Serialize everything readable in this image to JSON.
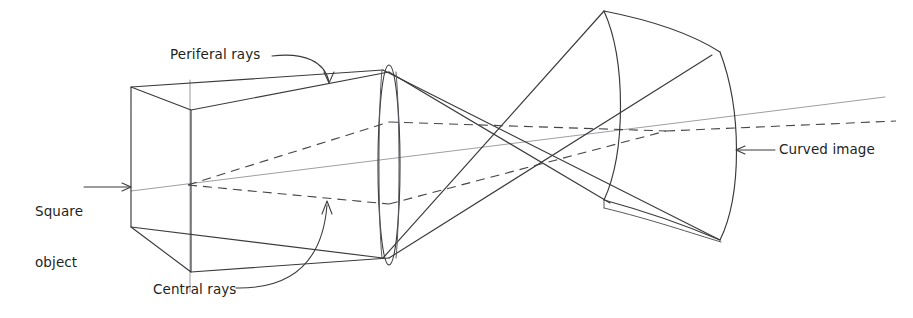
{
  "diagram": {
    "type": "optical-ray-diagram",
    "background_color": "#ffffff",
    "ink_color": "#3a3a3c",
    "axis_color": "#9a9a9e"
  },
  "labels": {
    "square_object": "Square\nobject",
    "square_object_line1": "Square",
    "square_object_line2": "object",
    "periferal_rays": "Periferal rays",
    "central_rays": "Central rays",
    "curved_image": "Curved image"
  },
  "elements": {
    "object_plane": {
      "name": "square object plane",
      "corners": [
        [
          131,
          87
        ],
        [
          191,
          110
        ],
        [
          191,
          272
        ],
        [
          131,
          227
        ]
      ]
    },
    "lens": {
      "name": "converging lens",
      "center_x": 389,
      "center_y": 165,
      "rx": 11,
      "ry": 100
    },
    "image_surface": {
      "name": "curved image surface",
      "corners": [
        [
          604,
          11
        ],
        [
          720,
          52
        ],
        [
          720,
          240
        ],
        [
          604,
          200
        ]
      ],
      "curvature": "concave toward lens"
    },
    "focal_point": {
      "name": "ray crossing point",
      "x": 525,
      "y": 148
    },
    "optical_axis": {
      "name": "optical axis",
      "from": [
        130,
        192
      ],
      "to": [
        885,
        98
      ]
    },
    "ray_sets": [
      {
        "name": "peripheral rays",
        "style": "solid",
        "count": 4
      },
      {
        "name": "central rays",
        "style": "dashed",
        "count": 4
      }
    ]
  }
}
